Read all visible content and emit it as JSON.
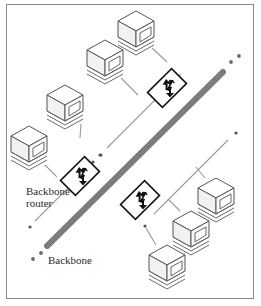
{
  "figure": {
    "kind": "network-topology-diagram",
    "background_color": "#ffffff",
    "frame_color": "#8a8a8a"
  },
  "labels": {
    "backbone_router": {
      "line1": "Backbone",
      "line2": "router",
      "x": 26,
      "y": 186
    },
    "backbone": {
      "text": "Backbone",
      "x": 48,
      "y": 255
    }
  },
  "colors": {
    "backbone_trunk": "#7c7c7c",
    "branch_line": "#9a9a9a",
    "drop_line": "#9a9a9a",
    "router_outline": "#111111",
    "router_fill": "#ffffff",
    "router_glyph": "#111111",
    "workstation_outline": "#5a5a5a",
    "workstation_fill": "#ffffff",
    "workstation_shade": "#d9d9d9",
    "ellipsis_dot": "#555555",
    "label_text": "#2b2b2b"
  },
  "backbone": {
    "name": "backbone-trunk",
    "stroke_width": 6,
    "x1": 47,
    "y1": 246,
    "x2": 223,
    "y2": 72,
    "end_dots": [
      {
        "cx": 231,
        "cy": 62,
        "r": 1.9
      },
      {
        "cx": 239,
        "cy": 56,
        "r": 1.9
      },
      {
        "cx": 41,
        "cy": 253,
        "r": 1.9
      },
      {
        "cx": 33,
        "cy": 259,
        "r": 1.9
      }
    ]
  },
  "routers": [
    {
      "id": "router-1",
      "name": "backbone-router-top",
      "cx": 167,
      "cy": 88,
      "half": 17,
      "attached_to_backbone": true
    },
    {
      "id": "router-2",
      "name": "backbone-router-left",
      "cx": 80,
      "cy": 176,
      "half": 17,
      "attached_to_backbone": true
    },
    {
      "id": "router-3",
      "name": "backbone-router-bottom",
      "cx": 140,
      "cy": 200,
      "half": 17,
      "attached_to_backbone": true
    }
  ],
  "branches": [
    {
      "id": "branch-1",
      "name": "branch-line-top",
      "router": "router-1",
      "x1": 181,
      "y1": 74,
      "x2": 107,
      "y2": 148,
      "ellipsis_dots": [
        {
          "cx": 100,
          "cy": 155,
          "r": 1.6
        },
        {
          "cx": 93,
          "cy": 162,
          "r": 1.6
        }
      ]
    },
    {
      "id": "branch-2",
      "name": "branch-line-left",
      "router": "router-2",
      "x1": 94,
      "y1": 162,
      "x2": 35,
      "y2": 221,
      "ellipsis_dots": [
        {
          "cx": 101,
          "cy": 155,
          "r": 1.6
        },
        {
          "cx": 30,
          "cy": 227,
          "r": 1.6
        }
      ]
    },
    {
      "id": "branch-3",
      "name": "branch-line-bottom",
      "router": "router-3",
      "x1": 154,
      "y1": 214,
      "x2": 228,
      "y2": 140,
      "ellipsis_dots": [
        {
          "cx": 236,
          "cy": 133,
          "r": 1.6
        },
        {
          "cx": 145,
          "cy": 226,
          "r": 1.6
        }
      ]
    }
  ],
  "workstations": [
    {
      "id": "ws-1",
      "name": "workstation-top-right",
      "x": 116,
      "y": 9,
      "w": 40,
      "h": 44,
      "tap_x": 152,
      "tap_y": 48,
      "drop_to_x": 167,
      "drop_to_y": 62
    },
    {
      "id": "ws-2",
      "name": "workstation-top-left",
      "x": 85,
      "y": 38,
      "w": 40,
      "h": 44,
      "tap_x": 121,
      "tap_y": 78,
      "drop_to_x": 138,
      "drop_to_y": 95
    },
    {
      "id": "ws-3",
      "name": "workstation-upper-left",
      "x": 45,
      "y": 83,
      "w": 40,
      "h": 44,
      "tap_x": 81,
      "tap_y": 124,
      "drop_to_x": 80,
      "drop_to_y": 138
    },
    {
      "id": "ws-4",
      "name": "workstation-far-left",
      "x": 9,
      "y": 124,
      "w": 40,
      "h": 44,
      "tap_x": 45,
      "tap_y": 165,
      "drop_to_x": 57,
      "drop_to_y": 177
    },
    {
      "id": "ws-5",
      "name": "workstation-right-top",
      "x": 196,
      "y": 176,
      "w": 40,
      "h": 44,
      "tap_x": 205,
      "tap_y": 178,
      "drop_to_x": 196,
      "drop_to_y": 167
    },
    {
      "id": "ws-6",
      "name": "workstation-right-mid",
      "x": 171,
      "y": 209,
      "w": 40,
      "h": 44,
      "tap_x": 180,
      "tap_y": 211,
      "drop_to_x": 168,
      "drop_to_y": 199
    },
    {
      "id": "ws-7",
      "name": "workstation-right-low",
      "x": 147,
      "y": 243,
      "w": 40,
      "h": 44,
      "tap_x": 156,
      "tap_y": 245,
      "drop_to_x": 146,
      "drop_to_y": 228
    }
  ]
}
